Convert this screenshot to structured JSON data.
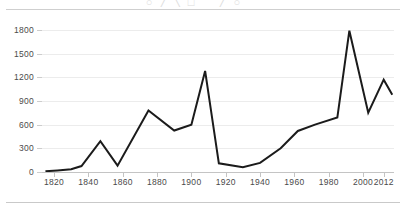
{
  "figure": {
    "title_clipped": "○ ╱ ╲ □ ⌒ ╱ ○ ⌒",
    "background_color": "#ffffff",
    "line_color": "#1b1b1b",
    "gridline_color": "#ececec",
    "axis_color": "#c4c4c4",
    "tick_label_color": "#4a4a4a",
    "rules": {
      "top_divider": "",
      "bottom_divider": ""
    }
  },
  "chart_data": {
    "type": "line",
    "title": "",
    "xlabel": "",
    "ylabel": "",
    "xlim": [
      1813,
      2018
    ],
    "ylim": [
      0,
      1900
    ],
    "grid": true,
    "legend": "none",
    "xticks": [
      1820,
      1840,
      1860,
      1880,
      1900,
      1920,
      1940,
      1960,
      1980,
      2000,
      2012
    ],
    "xtick_labels": [
      "1820",
      "1840",
      "1860",
      "1880",
      "1900",
      "1920",
      "1940",
      "1960",
      "1980",
      "2000",
      "2012"
    ],
    "yticks": [
      0,
      300,
      600,
      900,
      1200,
      1500,
      1800
    ],
    "ytick_labels": [
      "0",
      "300",
      "600",
      "900",
      "1200",
      "1500",
      "1800"
    ],
    "x": [
      1815,
      1822,
      1830,
      1836,
      1847,
      1857,
      1875,
      1890,
      1900,
      1908,
      1916,
      1930,
      1940,
      1952,
      1962,
      1972,
      1985,
      1992,
      2003,
      2012,
      2017
    ],
    "values": [
      10,
      20,
      35,
      75,
      390,
      80,
      780,
      525,
      600,
      1280,
      110,
      60,
      115,
      300,
      520,
      600,
      690,
      1790,
      750,
      1170,
      980
    ],
    "series": [
      {
        "name": "series-1",
        "x": [
          1815,
          1822,
          1830,
          1836,
          1847,
          1857,
          1875,
          1890,
          1900,
          1908,
          1916,
          1930,
          1940,
          1952,
          1962,
          1972,
          1985,
          1992,
          2003,
          2012,
          2017
        ],
        "values": [
          10,
          20,
          35,
          75,
          390,
          80,
          780,
          525,
          600,
          1280,
          110,
          60,
          115,
          300,
          520,
          600,
          690,
          1790,
          750,
          1170,
          980
        ]
      }
    ]
  }
}
